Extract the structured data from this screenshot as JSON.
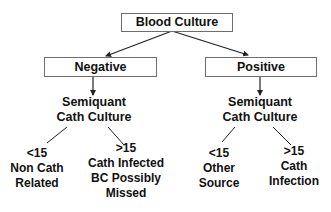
{
  "diagram": {
    "type": "decision-tree",
    "root": {
      "label": "Blood Culture"
    },
    "branches": [
      {
        "label": "Negative",
        "child": {
          "lines": [
            "Semiquant",
            "Cath Culture"
          ],
          "outcomes": [
            {
              "threshold": "<15",
              "lines": [
                "Non Cath",
                "Related"
              ]
            },
            {
              "threshold": ">15",
              "lines": [
                "Cath Infected",
                "BC Possibly",
                "Missed"
              ]
            }
          ]
        }
      },
      {
        "label": "Positive",
        "child": {
          "lines": [
            "Semiquant",
            "Cath Culture"
          ],
          "outcomes": [
            {
              "threshold": "<15",
              "lines": [
                "Other",
                "Source"
              ]
            },
            {
              "threshold": ">15",
              "lines": [
                "Cath",
                "Infection"
              ]
            }
          ]
        }
      }
    ],
    "colors": {
      "line": "#222222",
      "box_border": "#6e6e6e",
      "text": "#111111",
      "background": "#ffffff"
    }
  }
}
